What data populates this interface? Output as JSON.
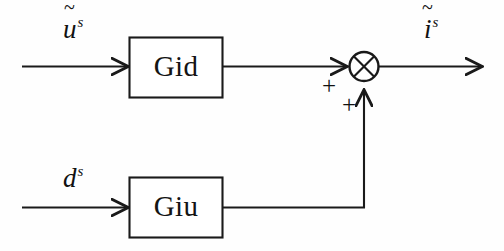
{
  "figure": {
    "type": "control-block-diagram",
    "background_color": "#fefefe",
    "line_color": "#1a1a1a",
    "width": 504,
    "height": 251
  },
  "blocks": [
    {
      "id": "gid",
      "label": "Gid",
      "x": 129,
      "y": 37,
      "width": 94,
      "height": 61
    },
    {
      "id": "giu",
      "label": "Giu",
      "x": 129,
      "y": 177,
      "width": 94,
      "height": 61
    }
  ],
  "signals": {
    "input_top": {
      "base": "u",
      "accent": "~",
      "superscript": "s",
      "text": "ũˢ"
    },
    "input_bottom": {
      "base": "d",
      "accent": "",
      "superscript": "s",
      "text": "dˢ"
    },
    "output": {
      "base": "i",
      "accent": "~",
      "superscript": "s",
      "text": "ĩˢ"
    }
  },
  "summing_junction": {
    "id": "sum",
    "kind": "cross-circle",
    "center_x": 364,
    "center_y": 66,
    "radius": 15,
    "signs": [
      {
        "id": "sign-top-input",
        "label": "+",
        "x": 322,
        "y": 73
      },
      {
        "id": "sign-bottom-input",
        "label": "+",
        "x": 342,
        "y": 92
      }
    ]
  },
  "connections": [
    {
      "id": "u-to-gid",
      "from": "input_top",
      "to": "gid",
      "arrow": true
    },
    {
      "id": "gid-to-sum",
      "from": "gid",
      "to": "sum",
      "arrow": true,
      "sign": "+"
    },
    {
      "id": "d-to-giu",
      "from": "input_bottom",
      "to": "giu",
      "arrow": true
    },
    {
      "id": "giu-to-sum",
      "from": "giu",
      "to": "sum",
      "arrow": true,
      "sign": "+"
    },
    {
      "id": "sum-to-output",
      "from": "sum",
      "to": "output",
      "arrow": true
    }
  ]
}
